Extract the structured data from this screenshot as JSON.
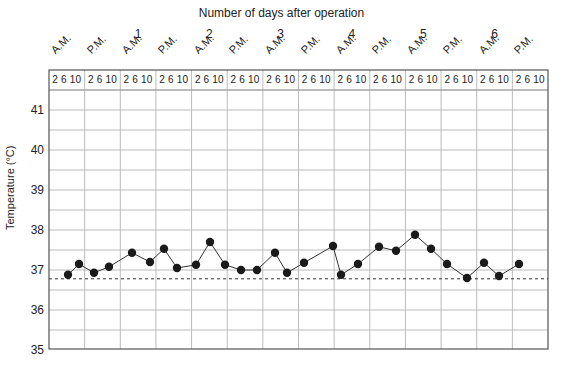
{
  "chart_data": {
    "type": "line",
    "title": "Number of days after operation",
    "xlabel": "Number of days after operation",
    "ylabel": "Temperature (°C)",
    "ylim": [
      35,
      41.5
    ],
    "yticks": [
      35,
      36,
      37,
      38,
      39,
      40,
      41
    ],
    "day_labels": [
      "1",
      "2",
      "3",
      "4",
      "5",
      "6"
    ],
    "period_labels": [
      "A.M.",
      "P.M.",
      "A.M.",
      "P.M.",
      "A.M.",
      "P.M.",
      "A.M.",
      "P.M.",
      "A.M.",
      "P.M.",
      "A.M.",
      "P.M.",
      "A.M.",
      "P.M."
    ],
    "hour_labels": [
      "2 6 10"
    ],
    "reference_line": {
      "value": 36.78,
      "style": "dashed"
    },
    "grid": true,
    "series": [
      {
        "name": "Temperature",
        "x_px": [
          68,
          79,
          94,
          109,
          132,
          150,
          164,
          177,
          196,
          210,
          225,
          241,
          257,
          275,
          287,
          304,
          333,
          341,
          358,
          379,
          396,
          415,
          431,
          447,
          467,
          484,
          499,
          519
        ],
        "values": [
          36.88,
          37.15,
          36.93,
          37.08,
          37.43,
          37.2,
          37.53,
          37.05,
          37.13,
          37.7,
          37.13,
          37.0,
          37.0,
          37.43,
          36.93,
          37.18,
          37.6,
          36.88,
          37.15,
          37.58,
          37.48,
          37.88,
          37.53,
          37.15,
          36.8,
          37.18,
          36.85,
          37.15
        ]
      }
    ]
  },
  "labels": {
    "title": "Number of days after operation",
    "ylabel": "Temperature (°C)",
    "hours": "2 6 10"
  }
}
